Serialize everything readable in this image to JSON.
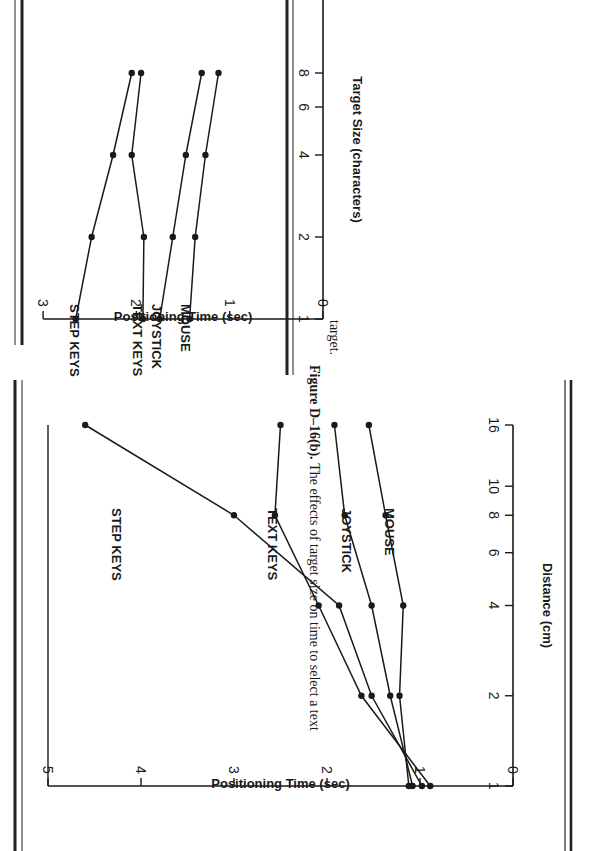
{
  "chart_data": [
    {
      "type": "line",
      "title": "",
      "xlabel": "Distance (cm)",
      "ylabel": "Positioning Time (sec)",
      "x_scale": "log",
      "x_ticks": [
        "1",
        "2",
        "4",
        "6",
        "8",
        "10",
        "16"
      ],
      "y_ticks": [
        "0",
        "1",
        "2",
        "3",
        "4",
        "5"
      ],
      "ylim": [
        0,
        5
      ],
      "x": [
        1,
        2,
        4,
        8,
        16
      ],
      "series": [
        {
          "name": "STEP KEYS",
          "values": [
            0.98,
            1.52,
            1.87,
            3.0,
            4.6
          ]
        },
        {
          "name": "TEXT KEYS",
          "values": [
            0.89,
            1.63,
            2.09,
            2.56,
            2.5
          ]
        },
        {
          "name": "JOYSTICK",
          "values": [
            1.08,
            1.32,
            1.52,
            1.81,
            1.92
          ]
        },
        {
          "name": "MOUSE",
          "values": [
            1.12,
            1.22,
            1.18,
            1.37,
            1.55
          ]
        }
      ],
      "caption": ""
    },
    {
      "type": "line",
      "title": "",
      "xlabel": "Target Size (characters)",
      "ylabel": "Positioning Time (sec)",
      "x_scale": "log",
      "x_ticks": [
        "1",
        "2",
        "4",
        "6",
        "8"
      ],
      "y_ticks": [
        "0",
        "1",
        "2",
        "3"
      ],
      "ylim": [
        0,
        3
      ],
      "x": [
        1,
        2,
        4,
        8
      ],
      "series": [
        {
          "name": "STEP KEYS",
          "values": [
            2.65,
            2.48,
            2.25,
            2.05
          ]
        },
        {
          "name": "TEXT KEYS",
          "values": [
            1.93,
            1.92,
            2.05,
            1.95
          ]
        },
        {
          "name": "JOYSTICK",
          "values": [
            1.75,
            1.61,
            1.47,
            1.3
          ]
        },
        {
          "name": "MOUSE",
          "values": [
            1.43,
            1.37,
            1.26,
            1.12
          ]
        }
      ],
      "caption": "Figure D–16(b).  The effects of target size on time to select a text target."
    }
  ],
  "figure_b": {
    "caption_label": "Figure D–16(b).",
    "caption_text": "The effects of target size on time to select a text",
    "caption_text2": "target."
  }
}
